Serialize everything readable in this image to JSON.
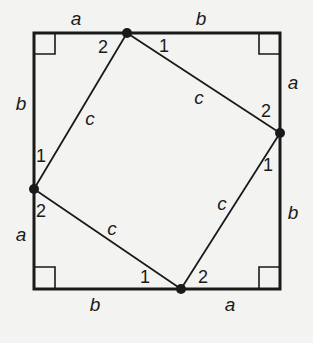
{
  "diagram": {
    "colors": {
      "stroke": "#1a1a1a",
      "background": "#f3f3f1"
    },
    "outer_square": {
      "x1": 34,
      "y1": 33,
      "x2": 280,
      "y2": 289
    },
    "inner_vertices": {
      "top": {
        "x": 127,
        "y": 33
      },
      "right": {
        "x": 280,
        "y": 133
      },
      "bottom": {
        "x": 181,
        "y": 289
      },
      "left": {
        "x": 34,
        "y": 189
      }
    },
    "side_labels": {
      "top_left": "a",
      "top_right": "b",
      "right_upper": "a",
      "right_lower": "b",
      "bottom_right": "a",
      "bottom_left": "b",
      "left_lower": "a",
      "left_upper": "b"
    },
    "hypotenuse_labels": {
      "top_left": "c",
      "top_right": "c",
      "bottom_right": "c",
      "bottom_left": "c"
    },
    "angle_labels": {
      "top_vertex_left": "2",
      "top_vertex_right": "1",
      "right_vertex_upper": "2",
      "right_vertex_lower": "1",
      "bottom_vertex_right": "2",
      "bottom_vertex_left": "1",
      "left_vertex_lower": "2",
      "left_vertex_upper": "1"
    }
  }
}
